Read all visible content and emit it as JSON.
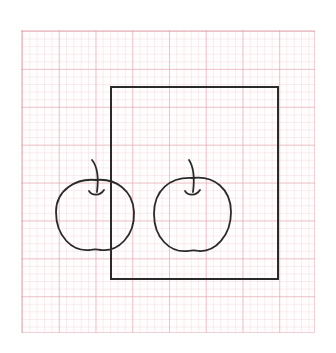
{
  "scene": {
    "description": "Hand-drawn sketch on pink graph paper: a rectangle with two apples, the left apple partially overlapping the rectangle's left edge",
    "colors": {
      "background": "#ffffff",
      "grid_line": "#e2a0aa",
      "ink": "#2a2a2a"
    },
    "objects": [
      {
        "type": "graph-paper",
        "x": 21,
        "y": 30,
        "width": 294,
        "height": 303
      },
      {
        "type": "rectangle",
        "x": 111,
        "y": 87,
        "width": 167,
        "height": 192
      },
      {
        "type": "apple",
        "name": "left-apple",
        "cx": 95,
        "cy": 214,
        "rx": 40,
        "ry": 40
      },
      {
        "type": "apple",
        "name": "right-apple",
        "cx": 192,
        "cy": 212,
        "rx": 39,
        "ry": 40
      }
    ]
  }
}
